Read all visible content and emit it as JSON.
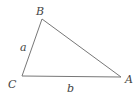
{
  "diagram": {
    "type": "triangle",
    "stroke_color": "#777777",
    "vertices": [
      {
        "name": "A",
        "x": 121,
        "y": 77
      },
      {
        "name": "B",
        "x": 42,
        "y": 19
      },
      {
        "name": "C",
        "x": 22,
        "y": 76
      }
    ],
    "vertex_labels": {
      "A": "A",
      "B": "B",
      "C": "C"
    },
    "side_labels": {
      "a": "a",
      "b": "b"
    }
  }
}
